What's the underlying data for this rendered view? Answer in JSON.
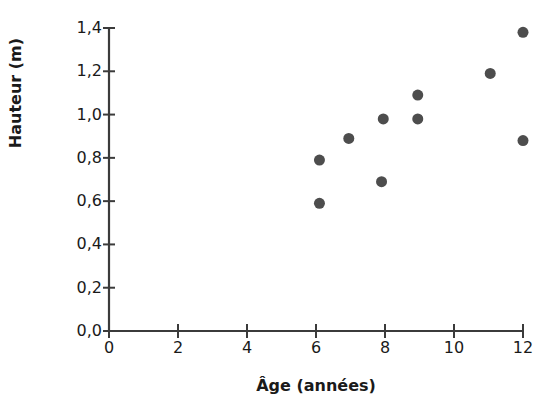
{
  "chart_data": {
    "type": "scatter",
    "title": "",
    "xlabel": "Âge (années)",
    "ylabel": "Hauteur (m)",
    "xlim": [
      0,
      12
    ],
    "ylim": [
      0,
      1.4
    ],
    "xticks": [
      "0",
      "2",
      "4",
      "6",
      "8",
      "10",
      "12"
    ],
    "xtick_values": [
      0,
      2,
      4,
      6,
      8,
      10,
      12
    ],
    "yticks": [
      "0,0",
      "0,2",
      "0,4",
      "0,6",
      "0,8",
      "1,0",
      "1,2",
      "1,4"
    ],
    "ytick_values": [
      0.0,
      0.2,
      0.4,
      0.6,
      0.8,
      1.0,
      1.2,
      1.4
    ],
    "decimal_separator": ",",
    "grid": false,
    "legend": false,
    "marker": "circle",
    "marker_color": "#4d4d4d",
    "marker_size": 11,
    "axis_color": "#3b3b3b",
    "x": [
      6.1,
      6.1,
      6.95,
      7.9,
      7.95,
      8.95,
      8.95,
      11.05,
      12.0,
      12.0
    ],
    "y": [
      0.79,
      0.59,
      0.89,
      0.69,
      0.98,
      1.09,
      0.98,
      1.19,
      1.38,
      0.88
    ],
    "points": [
      {
        "x": 6.1,
        "y": 0.79
      },
      {
        "x": 6.1,
        "y": 0.59
      },
      {
        "x": 6.95,
        "y": 0.89
      },
      {
        "x": 7.9,
        "y": 0.69
      },
      {
        "x": 7.95,
        "y": 0.98
      },
      {
        "x": 8.95,
        "y": 1.09
      },
      {
        "x": 8.95,
        "y": 0.98
      },
      {
        "x": 11.05,
        "y": 1.19
      },
      {
        "x": 12.0,
        "y": 1.38
      },
      {
        "x": 12.0,
        "y": 0.88
      }
    ]
  },
  "figure": {
    "clipped_title": "",
    "background": "#ffffff"
  }
}
